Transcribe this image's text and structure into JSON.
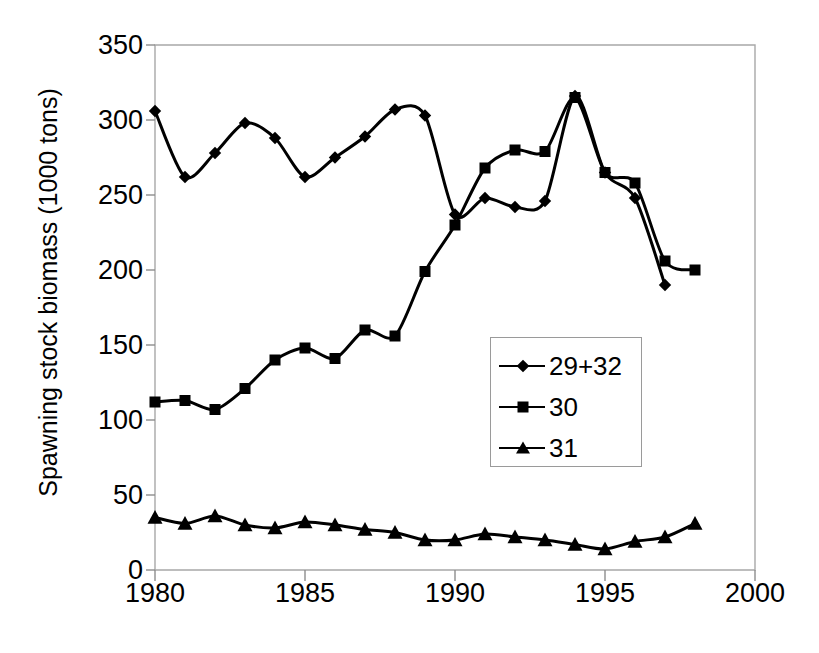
{
  "chart_data": {
    "type": "line",
    "title": "",
    "subtitle": "",
    "xlabel": "",
    "ylabel": "Spawning stock biomass  (1000 tons)",
    "xlim": [
      1980,
      2000
    ],
    "ylim": [
      0,
      350
    ],
    "xticks": [
      "1980",
      "1985",
      "1990",
      "1995",
      "2000"
    ],
    "xtick_values": [
      1980,
      1985,
      1990,
      1995,
      2000
    ],
    "yticks": [
      "0",
      "50",
      "100",
      "150",
      "200",
      "250",
      "300",
      "350"
    ],
    "ytick_values": [
      0,
      50,
      100,
      150,
      200,
      250,
      300,
      350
    ],
    "grid": false,
    "legend_position": "center-right",
    "x": [
      1980,
      1981,
      1982,
      1983,
      1984,
      1985,
      1986,
      1987,
      1988,
      1989,
      1990,
      1991,
      1992,
      1993,
      1994,
      1995,
      1996,
      1997,
      1998
    ],
    "series": [
      {
        "name": "29+32",
        "marker": "diamond",
        "color": "#000000",
        "values": [
          306,
          262,
          278,
          298,
          288,
          262,
          275,
          289,
          307,
          303,
          237,
          248,
          242,
          246,
          316,
          265,
          248,
          190,
          null
        ]
      },
      {
        "name": "30",
        "marker": "square",
        "color": "#000000",
        "values": [
          112,
          113,
          107,
          121,
          140,
          148,
          141,
          160,
          156,
          199,
          230,
          268,
          280,
          279,
          315,
          265,
          258,
          206,
          200
        ]
      },
      {
        "name": "31",
        "marker": "triangle",
        "color": "#000000",
        "values": [
          35,
          31,
          36,
          30,
          28,
          32,
          30,
          27,
          25,
          20,
          20,
          24,
          22,
          20,
          17,
          14,
          19,
          22,
          31
        ]
      }
    ]
  },
  "legend": {
    "entries": [
      {
        "label": "29+32",
        "marker": "diamond"
      },
      {
        "label": "30",
        "marker": "square"
      },
      {
        "label": "31",
        "marker": "triangle"
      }
    ]
  },
  "axes": {
    "y_label_text": "Spawning stock biomass  (1000 tons)",
    "y_tick_labels": [
      "350",
      "300",
      "250",
      "200",
      "150",
      "100",
      "50",
      "0"
    ],
    "x_tick_labels": [
      "1980",
      "1985",
      "1990",
      "1995",
      "2000"
    ]
  }
}
